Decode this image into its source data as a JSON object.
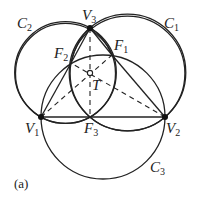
{
  "figure": {
    "caption": "(a)",
    "points": {
      "V1": {
        "label": "V",
        "sub": "1"
      },
      "V2": {
        "label": "V",
        "sub": "2"
      },
      "V3": {
        "label": "V",
        "sub": "3"
      },
      "F1": {
        "label": "F",
        "sub": "1"
      },
      "F2": {
        "label": "F",
        "sub": "2"
      },
      "F3": {
        "label": "F",
        "sub": "3"
      },
      "T": {
        "label": "T"
      }
    },
    "circles": {
      "C1": {
        "label": "C",
        "sub": "1"
      },
      "C2": {
        "label": "C",
        "sub": "2"
      },
      "C3": {
        "label": "C",
        "sub": "3"
      }
    },
    "stroke_color": "#222222"
  }
}
